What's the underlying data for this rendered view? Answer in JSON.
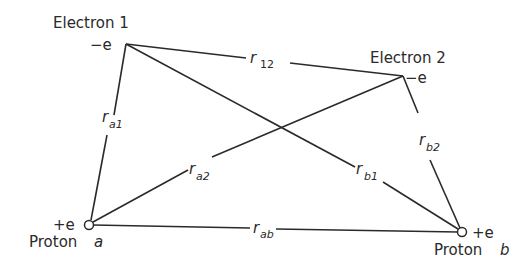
{
  "diagram": {
    "nodes": {
      "electron1": {
        "name": "Electron 1",
        "charge": "−e",
        "x": 126,
        "y": 44
      },
      "electron2": {
        "name": "Electron 2",
        "charge": "−e",
        "x": 403,
        "y": 76
      },
      "protonA": {
        "name": "Proton",
        "letter": "a",
        "charge": "+e",
        "x": 89,
        "y": 225
      },
      "protonB": {
        "name": "Proton",
        "letter": "b",
        "charge": "+e",
        "x": 462,
        "y": 232
      }
    },
    "edges": {
      "r12": {
        "base": "r",
        "sub": "12",
        "from": "electron1",
        "to": "electron2"
      },
      "ra1": {
        "base": "r",
        "sub": "a1",
        "from": "protonA",
        "to": "electron1"
      },
      "ra2": {
        "base": "r",
        "sub": "a2",
        "from": "protonA",
        "to": "electron2"
      },
      "rb1": {
        "base": "r",
        "sub": "b1",
        "from": "protonB",
        "to": "electron1"
      },
      "rb2": {
        "base": "r",
        "sub": "b2",
        "from": "protonB",
        "to": "electron2"
      },
      "rab": {
        "base": "r",
        "sub": "ab",
        "from": "protonA",
        "to": "protonB"
      }
    },
    "colors": {
      "line": "#2a2a2a",
      "background": "#ffffff"
    }
  }
}
